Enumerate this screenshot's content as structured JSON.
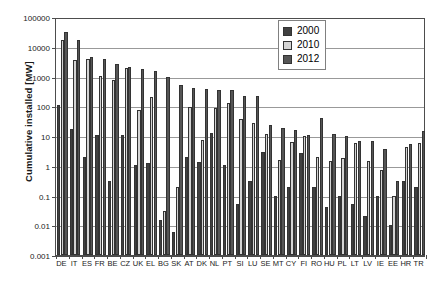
{
  "chart_data": {
    "type": "bar",
    "title": "",
    "xlabel": "",
    "ylabel": "Cumulative installed [MW]",
    "yscale": "log",
    "ylim": [
      0.001,
      100000
    ],
    "yticks": [
      0.001,
      0.01,
      0.1,
      1,
      10,
      100,
      1000,
      10000,
      100000
    ],
    "ytick_labels": [
      "0.001",
      "0.01",
      "0.1",
      "1",
      "10",
      "100",
      "1000",
      "10000",
      "100000"
    ],
    "grid": true,
    "legend_position": "top-right",
    "categories": [
      "DE",
      "IT",
      "ES",
      "FR",
      "BE",
      "CZ",
      "UK",
      "EL",
      "BG",
      "SK",
      "AT",
      "DK",
      "NL",
      "PT",
      "SI",
      "LU",
      "SE",
      "MT",
      "CY",
      "FI",
      "RO",
      "HU",
      "PL",
      "LT",
      "LV",
      "IE",
      "EE",
      "HR",
      "TR"
    ],
    "series": [
      {
        "name": "2000",
        "color": "#404040",
        "values": [
          114,
          17,
          2,
          11,
          0.3,
          11,
          1.1,
          1.2,
          0.015,
          0.006,
          2,
          1.3,
          12.8,
          1.1,
          0.05,
          0.3,
          2.8,
          0.1,
          0.2,
          2.6,
          0.2,
          0.04,
          0.1,
          0.05,
          0.02,
          0.1,
          0.01,
          0.3,
          0.2
        ]
      },
      {
        "name": "2010",
        "color": "#d4d4d4",
        "values": [
          17370,
          3470,
          3860,
          1050,
          790,
          1960,
          76,
          206,
          0.03,
          0.2,
          96,
          7.1,
          88,
          130,
          36,
          26.4,
          11.4,
          1.6,
          6.2,
          9.7,
          2,
          1.5,
          1.8,
          6,
          1.5,
          0.7,
          0.1,
          4.3,
          6
        ]
      },
      {
        "name": "2012",
        "color": "#555555",
        "values": [
          32410,
          16350,
          4540,
          4010,
          2650,
          2020,
          1830,
          1540,
          930,
          520,
          420,
          390,
          365,
          340,
          220,
          217,
          24,
          18,
          16,
          11,
          41,
          12,
          10,
          7,
          7,
          3.7,
          0.3,
          5.5,
          15
        ]
      }
    ],
    "legend": [
      {
        "label": "2000",
        "color": "#404040"
      },
      {
        "label": "2010",
        "color": "#d4d4d4"
      },
      {
        "label": "2012",
        "color": "#555555"
      }
    ]
  }
}
